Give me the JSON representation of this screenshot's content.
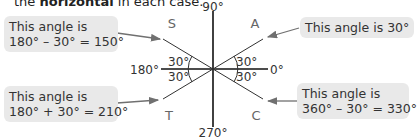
{
  "caption": {
    "prefix": "the ",
    "bold": "horizontal",
    "suffix": " in each case."
  },
  "diagram": {
    "axis_labels": {
      "top": "90°",
      "bottom": "270°",
      "left": "180°",
      "right": "0°"
    },
    "quadrant_labels": {
      "top_left": "S",
      "top_right": "A",
      "bottom_left": "T",
      "bottom_right": "C"
    },
    "angle_marks": {
      "top_left": "30°",
      "bottom_left": "30°",
      "top_right": "30°",
      "bottom_right": "30°"
    },
    "callouts": {
      "top_left": {
        "line1": "This angle is",
        "line2": "180° – 30° = 150°"
      },
      "top_right": {
        "line1": "This angle is 30°"
      },
      "bottom_left": {
        "line1": "This angle is",
        "line2": "180° + 30° = 210°"
      },
      "bottom_right": {
        "line1": "This angle is",
        "line2": "360° – 30° = 330°"
      }
    },
    "colors": {
      "line": "#111111",
      "arrow": "#707070",
      "box_bg": "#e9e9e9",
      "letters": "#666666"
    }
  }
}
